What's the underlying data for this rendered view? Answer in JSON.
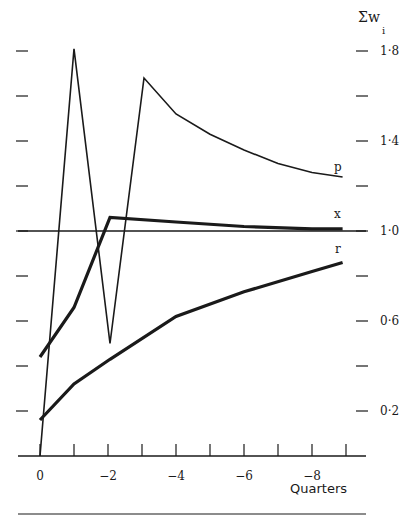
{
  "chart_data": {
    "type": "line",
    "title": "",
    "xlabel": "Quarters",
    "ylabel": "Σw_i",
    "ylabel_main": "Σw",
    "ylabel_sub": "i",
    "x": [
      0,
      -1,
      -2,
      -3,
      -4,
      -5,
      -6,
      -7,
      -8,
      -9
    ],
    "x_tick_labels": [
      "0",
      "−2",
      "−4",
      "−6",
      "−8"
    ],
    "x_tick_values": [
      0,
      -2,
      -4,
      -6,
      -8
    ],
    "y_tick_labels": [
      "1·8",
      "1·4",
      "1·0",
      "0·6",
      "0·2"
    ],
    "y_tick_values": [
      1.8,
      1.4,
      1.0,
      0.6,
      0.2
    ],
    "y_minor_ticks": [
      1.8,
      1.6,
      1.4,
      1.2,
      1.0,
      0.8,
      0.6,
      0.4,
      0.2
    ],
    "ylim": [
      0,
      1.8
    ],
    "xlim": [
      0,
      -9
    ],
    "reference_line": 1.0,
    "grid": false,
    "legend": "inline labels at right end of each series",
    "series": [
      {
        "name": "p",
        "style": "thin",
        "points": [
          [
            0,
            0.0
          ],
          [
            -1,
            1.81
          ],
          [
            -2.06,
            0.5
          ],
          [
            -3.06,
            1.68
          ],
          [
            -4,
            1.52
          ],
          [
            -5,
            1.43
          ],
          [
            -6,
            1.36
          ],
          [
            -7,
            1.3
          ],
          [
            -8,
            1.26
          ],
          [
            -8.9,
            1.24
          ]
        ]
      },
      {
        "name": "x",
        "style": "thick",
        "points": [
          [
            0,
            0.44
          ],
          [
            -1,
            0.66
          ],
          [
            -2.06,
            1.06
          ],
          [
            -4,
            1.04
          ],
          [
            -6,
            1.02
          ],
          [
            -8,
            1.01
          ],
          [
            -8.9,
            1.01
          ]
        ]
      },
      {
        "name": "r",
        "style": "thick",
        "points": [
          [
            0,
            0.16
          ],
          [
            -1,
            0.32
          ],
          [
            -2.06,
            0.43
          ],
          [
            -4,
            0.62
          ],
          [
            -6,
            0.73
          ],
          [
            -8,
            0.82
          ],
          [
            -8.9,
            0.86
          ]
        ]
      }
    ]
  },
  "labels": {
    "p": "p",
    "x": "x",
    "r": "r",
    "xlabel": "Quarters",
    "ylabel_main": "Σw",
    "ylabel_sub": "i"
  }
}
